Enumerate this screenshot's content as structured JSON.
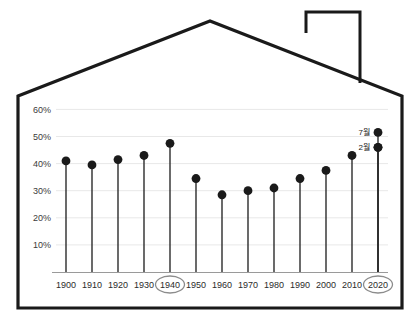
{
  "chart_data": {
    "type": "line",
    "title": "",
    "subtitle": "",
    "xlabel": "",
    "ylabel": "",
    "grid": true,
    "legend_position": "none",
    "xlim": [
      1900,
      2020
    ],
    "ylim": [
      0,
      60
    ],
    "ytick_labels": [
      "60%",
      "50%",
      "40%",
      "30%",
      "20%",
      "10%"
    ],
    "ytick_values": [
      60,
      50,
      40,
      30,
      20,
      10
    ],
    "categories": [
      "1900",
      "1910",
      "1920",
      "1930",
      "1940",
      "1950",
      "1960",
      "1970",
      "1980",
      "1990",
      "2000",
      "2010",
      "2020"
    ],
    "xtick_labels": [
      "1900",
      "1910",
      "1920",
      "1930",
      "1940",
      "1950",
      "1960",
      "1970",
      "1980",
      "1990",
      "2000",
      "2010",
      "2020"
    ],
    "highlighted_xticks": [
      "1940",
      "2020"
    ],
    "series": [
      {
        "name": "main",
        "marker": "circle",
        "values": [
          41,
          39.5,
          41.5,
          43,
          47.5,
          34.5,
          28.5,
          30,
          31,
          34.5,
          37.5,
          43,
          46
        ]
      }
    ],
    "extra_points": [
      {
        "category": "2020",
        "value": 51.5,
        "label": "7월"
      },
      {
        "category": "2020",
        "value": 46,
        "label": "2월"
      }
    ],
    "annotations": [
      {
        "text": "7월",
        "target_category": "2020",
        "target_value": 51.5
      },
      {
        "text": "2월",
        "target_category": "2020",
        "target_value": 46
      }
    ],
    "colors": {
      "marker": "#1a1a1a",
      "stem": "#2b2b2b",
      "grid": "#e8e8e8",
      "axis": "#9a9a9a",
      "house_outline": "#1a1a1a",
      "highlight_circle": "#8c8c8c",
      "background": "#ffffff"
    }
  },
  "frame": {
    "shape_name": "house-outline",
    "chimney": true
  }
}
